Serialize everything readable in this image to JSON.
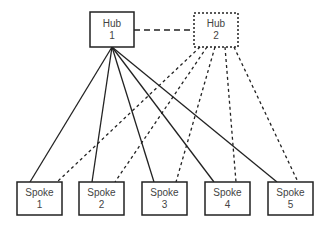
{
  "hubs": [
    {
      "id": "hub1",
      "line1": "Hub",
      "line2": "1",
      "style": "solid"
    },
    {
      "id": "hub2",
      "line1": "Hub",
      "line2": "2",
      "style": "dotted"
    }
  ],
  "spokes": [
    {
      "line1": "Spoke",
      "line2": "1"
    },
    {
      "line1": "Spoke",
      "line2": "2"
    },
    {
      "line1": "Spoke",
      "line2": "3"
    },
    {
      "line1": "Spoke",
      "line2": "4"
    },
    {
      "line1": "Spoke",
      "line2": "5"
    }
  ],
  "links": {
    "hub_to_hub": "dashed",
    "hub1_to_spokes": "solid",
    "hub2_to_spokes": "dotted"
  },
  "colors": {
    "stroke": "#222222",
    "text": "#444444"
  }
}
